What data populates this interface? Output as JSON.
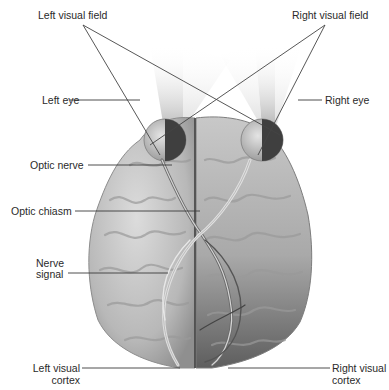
{
  "diagram": {
    "labels": {
      "left_visual_field": "Left visual field",
      "right_visual_field": "Right visual field",
      "left_eye": "Left eye",
      "right_eye": "Right eye",
      "optic_nerve": "Optic nerve",
      "optic_chiasm": "Optic chiasm",
      "nerve_signal_line1": "Nerve",
      "nerve_signal_line2": "signal",
      "left_visual_cortex_line1": "Left visual",
      "left_visual_cortex_line2": "cortex",
      "right_visual_cortex_line1": "Right visual",
      "right_visual_cortex_line2": "cortex"
    },
    "colors": {
      "background": "#ffffff",
      "brain_light": "#c9c9c9",
      "brain_shadow": "#8a8a8a",
      "right_hemisphere_dark": "#6e6e6e",
      "leader_line": "#3a3a3a",
      "label_text": "#2a2a2a"
    }
  }
}
